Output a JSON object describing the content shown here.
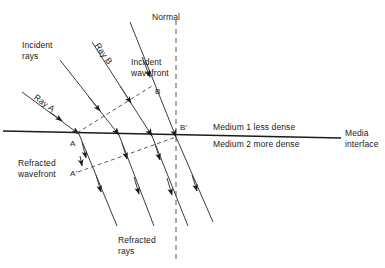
{
  "figure": {
    "title_implicit": "Refraction of light at a media interface",
    "labels": {
      "normal": "Normal",
      "incident_rays": "Incident\nrays",
      "ray_a": "Ray A",
      "ray_b": "Ray B",
      "incident_wavefront": "Incident\nwavefront",
      "refracted_wavefront": "Refracted\nwavefront",
      "refracted_rays": "Refracted\nrays",
      "medium_1": "Medium 1 less dense",
      "medium_2": "Medium 2 more dense",
      "media_interface": "Media\ninterface",
      "point_a": "A",
      "point_a_prime": "A'",
      "point_b": "B",
      "point_b_prime": "B'"
    },
    "colors": {
      "line": "#1a1a1a",
      "text": "#1a1a1a",
      "background": "#ffffff"
    },
    "geometry": {
      "interface": {
        "x1": 3,
        "y1": 131,
        "x2": 341,
        "y2": 138
      },
      "normal": {
        "x": 176,
        "y1": 20,
        "y2": 262,
        "dash": "5,4"
      },
      "incident_rays": [
        {
          "x1": 22,
          "y1": 92,
          "x2": 79,
          "y2": 134
        },
        {
          "x1": 60,
          "y1": 60,
          "x2": 119,
          "y2": 135
        },
        {
          "x1": 92,
          "y1": 42,
          "x2": 152,
          "y2": 136
        },
        {
          "x1": 130,
          "y1": 22,
          "x2": 176,
          "y2": 137
        }
      ],
      "refracted_rays": [
        {
          "x1": 79,
          "y1": 134,
          "x2": 117,
          "y2": 226
        },
        {
          "x1": 119,
          "y1": 135,
          "x2": 154,
          "y2": 226
        },
        {
          "x1": 152,
          "y1": 136,
          "x2": 188,
          "y2": 226
        },
        {
          "x1": 176,
          "y1": 137,
          "x2": 213,
          "y2": 222
        }
      ],
      "incident_wavefront": {
        "x1": 77,
        "y1": 133,
        "x2": 152,
        "y2": 86,
        "dash": "4,3"
      },
      "refracted_wavefront": {
        "x1": 78,
        "y1": 172,
        "x2": 176,
        "y2": 137,
        "dash": "4,3"
      },
      "points": [
        {
          "id": "A",
          "x": 79,
          "y": 134
        },
        {
          "id": "A'",
          "x": 78,
          "y": 172
        },
        {
          "id": "B",
          "x": 152,
          "y": 86
        },
        {
          "id": "B'",
          "x": 176,
          "y": 137
        }
      ]
    }
  }
}
